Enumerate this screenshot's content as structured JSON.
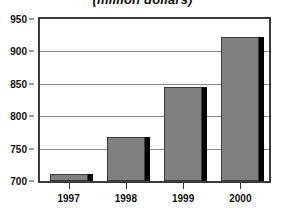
{
  "chart_data": {
    "type": "bar",
    "title": "(million dollars)",
    "xlabel": "",
    "ylabel": "",
    "categories": [
      "1997",
      "1998",
      "1999",
      "2000"
    ],
    "values": [
      711,
      768,
      845,
      922
    ],
    "ylim": [
      700,
      950
    ],
    "yticks": [
      700,
      750,
      800,
      850,
      900,
      950
    ],
    "ytick_labels": [
      "700",
      "750",
      "800",
      "850",
      "900",
      "950"
    ],
    "grid": true,
    "legend": false,
    "series": [
      {
        "name": "",
        "values": [
          711,
          768,
          845,
          922
        ]
      }
    ],
    "colors": {
      "bar_fill": "#808080",
      "bar_outline": "#3c3c3c",
      "bar_shadow": "#000000",
      "gridline": "#8d8d8d",
      "frame": "#3a3a3a",
      "text": "#111111",
      "background": "#ffffff"
    }
  }
}
